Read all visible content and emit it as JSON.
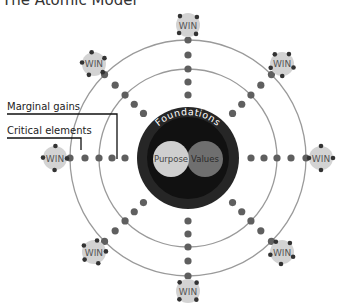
{
  "title": "The Atomic Model",
  "center": {
    "x": 188,
    "y": 158
  },
  "rings": {
    "outer_r": 118,
    "inner_r": 89,
    "ring_color": "#9a9a9a"
  },
  "core": {
    "outer_r": 51,
    "outer_color": "#262626",
    "inner_r": 41,
    "inner_color": "#111111",
    "label": "Foundations",
    "purpose": {
      "label": "Purpose",
      "color": "#cfcfcf"
    },
    "values": {
      "label": "Values",
      "color": "#6f6f6f"
    }
  },
  "dot_color": "#5f5f5f",
  "win": {
    "label": "WIN",
    "fill": "#d3d3d3",
    "text_color": "#555555",
    "notch_color": "#333333"
  },
  "labels": {
    "marginal_gains": "Marginal gains",
    "critical_elements": "Critical elements"
  },
  "spoke_angles": [
    0,
    45,
    90,
    135,
    180,
    225,
    270,
    315
  ],
  "win_radius": 133
}
